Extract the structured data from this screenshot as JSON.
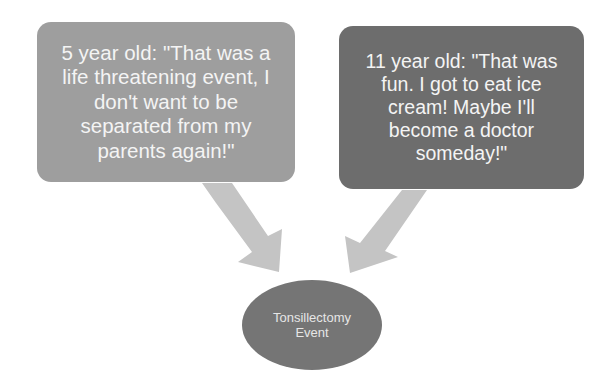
{
  "diagram": {
    "left_box": {
      "text": "5 year old: \"That was a life threatening event, I don't want to be separated from my parents again!\"",
      "fill": "#9e9e9e"
    },
    "right_box": {
      "text": "11 year old: \"That was fun. I got to eat ice cream! Maybe I'll become a doctor someday!\"",
      "fill": "#6d6d6d"
    },
    "center_node": {
      "text": "Tonsillectomy Event",
      "fill": "#757575"
    },
    "arrow_color": "#c4c4c4"
  }
}
